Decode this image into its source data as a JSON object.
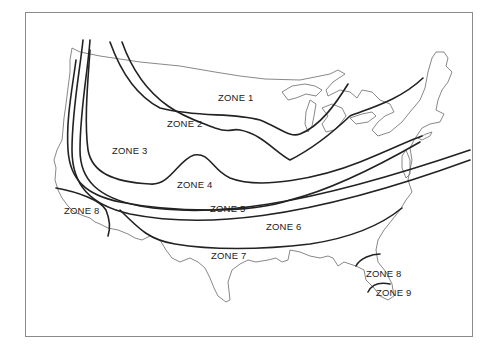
{
  "map": {
    "title": "",
    "subject": "United States climate/planting zones",
    "zones": [
      {
        "id": "zone-1",
        "label": "ZONE 1"
      },
      {
        "id": "zone-2",
        "label": "ZONE 2"
      },
      {
        "id": "zone-3",
        "label": "ZONE 3"
      },
      {
        "id": "zone-4",
        "label": "ZONE 4"
      },
      {
        "id": "zone-5",
        "label": "ZONE 5"
      },
      {
        "id": "zone-6",
        "label": "ZONE 6"
      },
      {
        "id": "zone-7",
        "label": "ZONE 7"
      },
      {
        "id": "zone-8-west",
        "label": "ZONE 8"
      },
      {
        "id": "zone-8-florida",
        "label": "ZONE 8"
      },
      {
        "id": "zone-9",
        "label": "ZONE 9"
      }
    ],
    "colors": {
      "zone_line": "#222222",
      "coastline": "#7a7a7a",
      "frame": "#8a8a8a",
      "background": "#ffffff"
    }
  }
}
